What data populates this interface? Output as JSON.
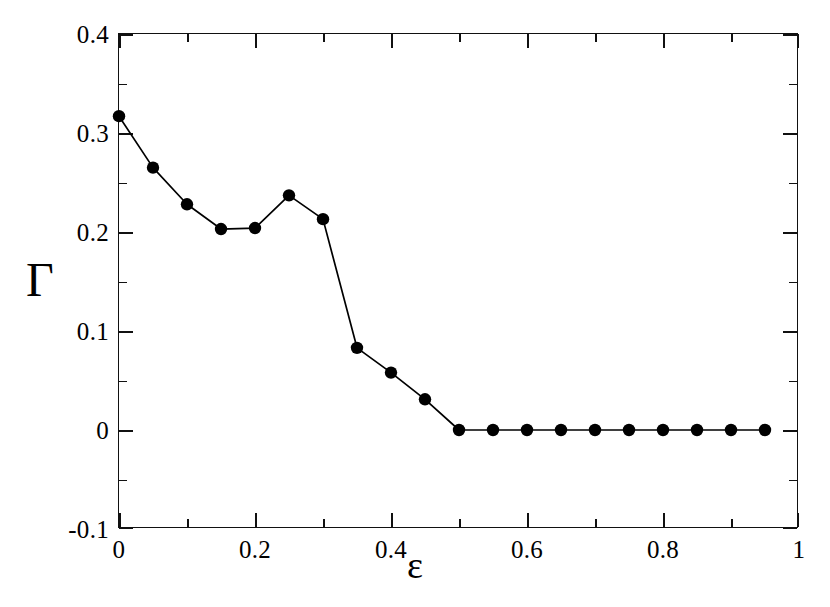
{
  "chart_data": {
    "type": "line",
    "title": "",
    "xlabel": "ε",
    "ylabel": "Γ",
    "xlim": [
      0,
      1
    ],
    "ylim": [
      -0.1,
      0.4
    ],
    "grid": false,
    "legend": null,
    "marker": "filled-circle",
    "line_color": "#000000",
    "marker_color": "#000000",
    "x_ticks_major": [
      0,
      0.2,
      0.4,
      0.6,
      0.8,
      1
    ],
    "x_tick_labels": [
      "0",
      "0.2",
      "0.4",
      "0.6",
      "0.8",
      "1"
    ],
    "x_ticks_minor": [
      0.1,
      0.3,
      0.5,
      0.7,
      0.9
    ],
    "y_ticks_major": [
      -0.1,
      0,
      0.1,
      0.2,
      0.3,
      0.4
    ],
    "y_tick_labels": [
      "-0.1",
      "0",
      "0.1",
      "0.2",
      "0.3",
      "0.4"
    ],
    "y_ticks_minor": [
      -0.05,
      0.05,
      0.15,
      0.25,
      0.35
    ],
    "series": [
      {
        "name": "Gamma vs epsilon",
        "x": [
          0,
          0.05,
          0.1,
          0.15,
          0.2,
          0.25,
          0.3,
          0.35,
          0.4,
          0.45,
          0.5,
          0.55,
          0.6,
          0.65,
          0.7,
          0.75,
          0.8,
          0.85,
          0.9,
          0.95
        ],
        "values": [
          0.317,
          0.265,
          0.228,
          0.203,
          0.204,
          0.237,
          0.213,
          0.083,
          0.058,
          0.031,
          0.0,
          0.0,
          0.0,
          0.0,
          0.0,
          0.0,
          0.0,
          0.0,
          0.0,
          0.0
        ]
      }
    ]
  }
}
